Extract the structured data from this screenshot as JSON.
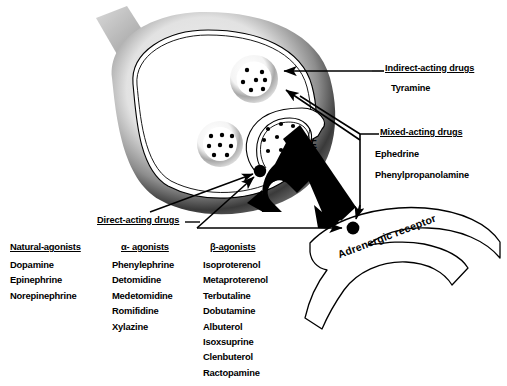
{
  "figure": {
    "ne_label": "NE",
    "receptor_label": "Adrenergic receptor"
  },
  "callouts": {
    "indirect": {
      "heading": "Indirect-acting drugs",
      "items": [
        "Tyramine"
      ]
    },
    "mixed": {
      "heading": "Mixed-acting drugs",
      "items": [
        "Ephedrine",
        "Phenylpropanolamine"
      ]
    },
    "direct": {
      "heading": "Direct-acting drugs"
    }
  },
  "drug_columns": [
    {
      "heading": "Natural-agonists",
      "items": [
        "Dopamine",
        "Epinephrine",
        "Norepinephrine"
      ]
    },
    {
      "heading": "α- agonists",
      "items": [
        "Phenylephrine",
        "Detomidine",
        "Medetomidine",
        "Romifidine",
        "Xylazine"
      ]
    },
    {
      "heading": "β-agonists",
      "items": [
        "Isoproterenol",
        "Metaproterenol",
        "Terbutaline",
        "Dobutamine",
        "Albuterol",
        "Isoxsuprine",
        "Clenbuterol",
        "Ractopamine"
      ]
    }
  ],
  "colors": {
    "ink": "#000000",
    "background": "#ffffff",
    "membrane_dark": "#2b2b2b",
    "membrane_mid": "#8a8a8a",
    "axon_gray": "#b9b9b9",
    "vesicle_gray": "#9c9c9c"
  },
  "diagram_parts": {
    "nerve_terminal": "presynaptic-nerve-terminal",
    "axon_stub": "axon-stub",
    "vesicles": [
      "vesicle-upper",
      "vesicle-lower",
      "vesicle-fusing"
    ],
    "release_site": "ne-release-site-dot",
    "receptor_dot": "receptor-binding-dot",
    "effector_cell": "effector-cell-membrane",
    "ne_arrow": "ne-release-arrow"
  }
}
